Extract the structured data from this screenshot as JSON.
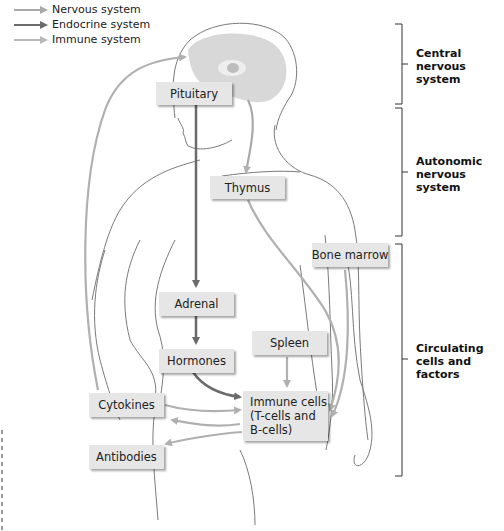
{
  "legend": {
    "items": [
      {
        "label": "Nervous system",
        "color": "#a9a9a9"
      },
      {
        "label": "Endocrine system",
        "color": "#6b6b6b"
      },
      {
        "label": "Immune system",
        "color": "#b8b8b8"
      }
    ]
  },
  "boxes": {
    "pituitary": "Pituitary",
    "thymus": "Thymus",
    "bone_marrow": "Bone marrow",
    "adrenal": "Adrenal",
    "hormones": "Hormones",
    "spleen": "Spleen",
    "immune_cells_line1": "Immune cells",
    "immune_cells_line2": "(T-cells and",
    "immune_cells_line3": "B-cells)",
    "cytokines": "Cytokines",
    "antibodies": "Antibodies"
  },
  "brackets": {
    "central": {
      "line1": "Central",
      "line2": "nervous",
      "line3": "system"
    },
    "autonomic": {
      "line1": "Autonomic",
      "line2": "nervous",
      "line3": "system"
    },
    "circulating": {
      "line1": "Circulating",
      "line2": "cells and",
      "line3": "factors"
    }
  },
  "colors": {
    "nervous": "#a9a9a9",
    "endocrine": "#6b6b6b",
    "immune": "#b8b8b8",
    "box_fill": "#e6e6e6",
    "outline": "#7a7a7a"
  }
}
